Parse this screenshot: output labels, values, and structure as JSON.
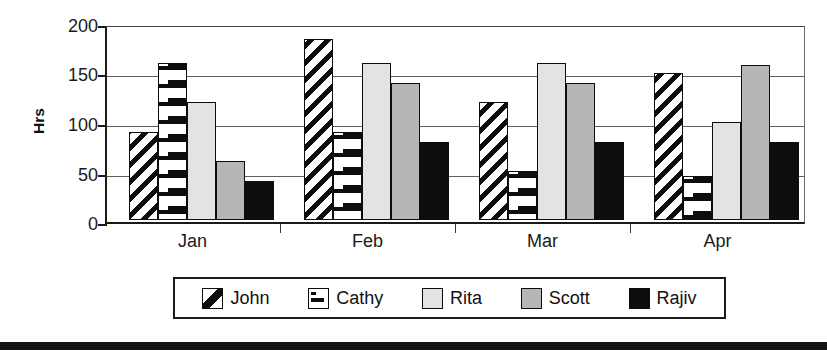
{
  "chart_data": {
    "type": "bar",
    "title": "",
    "xlabel": "",
    "ylabel": "Hrs",
    "categories": [
      "Jan",
      "Feb",
      "Mar",
      "Apr"
    ],
    "ylim": [
      0,
      200
    ],
    "yticks": [
      0,
      50,
      100,
      150,
      200
    ],
    "ytick_labels": [
      "0",
      "50",
      "100",
      "150",
      "200"
    ],
    "grid": true,
    "legend_position": "bottom",
    "series": [
      {
        "name": "John",
        "pattern": "diagonal-stripes",
        "color": "#0d0d0d",
        "values": [
          90,
          185,
          120,
          150
        ]
      },
      {
        "name": "Cathy",
        "pattern": "horizontal-dashes",
        "color": "#0d0d0d",
        "values": [
          160,
          90,
          50,
          45
        ]
      },
      {
        "name": "Rita",
        "pattern": "solid",
        "color": "#e3e3e3",
        "values": [
          120,
          160,
          160,
          100
        ]
      },
      {
        "name": "Scott",
        "pattern": "solid",
        "color": "#b6b6b6",
        "values": [
          60,
          140,
          140,
          158
        ]
      },
      {
        "name": "Rajiv",
        "pattern": "solid",
        "color": "#0d0d0d",
        "values": [
          40,
          80,
          80,
          80
        ]
      }
    ]
  },
  "axes": {
    "y_label": "Hrs",
    "y_tick_labels": [
      "200",
      "150",
      "100",
      "50",
      "0"
    ],
    "x_tick_labels": [
      "Jan",
      "Feb",
      "Mar",
      "Apr"
    ]
  },
  "legend": {
    "items": [
      {
        "label": "John",
        "swatch": "swatch-diagonal-stripes-icon"
      },
      {
        "label": "Cathy",
        "swatch": "swatch-dashes-icon"
      },
      {
        "label": "Rita",
        "swatch": "swatch-light-gray-icon"
      },
      {
        "label": "Scott",
        "swatch": "swatch-medium-gray-icon"
      },
      {
        "label": "Rajiv",
        "swatch": "swatch-black-icon"
      }
    ]
  },
  "colors": {
    "axis": "#1a1a1a",
    "grid": "#5f5f5f",
    "rita": "#e3e3e3",
    "scott": "#b6b6b6",
    "rajiv": "#0d0d0d",
    "bottom_rule": "#151515"
  }
}
